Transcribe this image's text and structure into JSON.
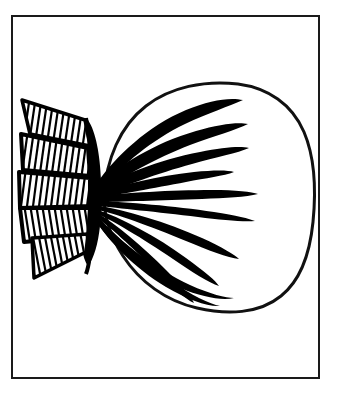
{
  "image": {
    "kind": "line-drawing",
    "title": "Ink line drawing of a plumed bulb-shaped form",
    "description": "A hand-drawn black ink illustration showing a rounded bulb on the right with thick tapering radiating strokes, joined at a narrow dark waist to a hatched fan-shaped tail on the left.",
    "background_color": "#ffffff",
    "ink_color": "#111111",
    "canvas": {
      "width": 342,
      "height": 410
    }
  },
  "frame": {
    "name": "rectangular border",
    "stroke_color": "#1a1a1a",
    "stroke_width": 2,
    "x": 11,
    "y": 15,
    "width": 309,
    "height": 364
  },
  "subject": {
    "bulb": {
      "label": "bulb outline",
      "stroke_color": "#111111",
      "stroke_width": 3,
      "center_x": 210,
      "center_y": 196,
      "radius_x": 102,
      "radius_y": 112
    },
    "waist": {
      "label": "dark convergence waist",
      "x": 96,
      "y": 190,
      "fill_color": "#000000"
    },
    "rays": {
      "label": "radiating tapering strokes",
      "count": 11,
      "fill_color": "#000000",
      "origin_x": 98,
      "origin_y": 192
    },
    "tail": {
      "label": "hatched fan tail",
      "band_count": 5,
      "hatch_color": "#000000",
      "hatch_line_width": 2.2,
      "edge_stroke_width": 4,
      "left_edge_x": 19,
      "right_edge_x": 100,
      "top_y": 96,
      "bottom_y": 278
    }
  }
}
